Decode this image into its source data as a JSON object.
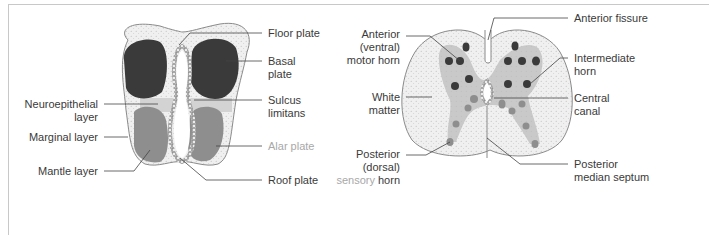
{
  "figure": {
    "left_panel": {
      "name": "Developing neural tube",
      "labels": {
        "floor_plate": "Floor plate",
        "basal_plate_1": "Basal",
        "basal_plate_2": "plate",
        "sulcus_limitans_1": "Sulcus",
        "sulcus_limitans_2": "limitans",
        "alar_plate": "Alar plate",
        "roof_plate": "Roof plate",
        "neuroepithelial_1": "Neuroepithelial",
        "neuroepithelial_2": "layer",
        "marginal_layer": "Marginal layer",
        "mantle_layer": "Mantle layer"
      }
    },
    "right_panel": {
      "name": "Spinal cord cross-section",
      "labels": {
        "anterior_fissure": "Anterior fissure",
        "anterior_horn_1": "Anterior",
        "anterior_horn_2": "(ventral)",
        "anterior_horn_3": "motor horn",
        "white_matter_1": "White",
        "white_matter_2": "matter",
        "posterior_horn_1": "Posterior",
        "posterior_horn_2": "(dorsal)",
        "posterior_horn_3a": "sensory",
        "posterior_horn_3b": " horn",
        "intermediate_horn_1": "Intermediate",
        "intermediate_horn_2": "horn",
        "central_canal_1": "Central",
        "central_canal_2": "canal",
        "posterior_septum_1": "Posterior",
        "posterior_septum_2": "median septum"
      }
    },
    "colors": {
      "outline": "#8a8a8a",
      "white_matter_fill": "#f0f0f0",
      "gray_matter_fill": "#c9c9c9",
      "basal_plate_fill": "#3a3a3a",
      "alar_plate_fill": "#8e8e8e",
      "dark_neurons": "#3a3a3a",
      "light_neurons": "#8e8e8e",
      "label_text": "#3a3a3a",
      "muted_text": "#a8a8a8",
      "leader_line": "#444444"
    }
  }
}
